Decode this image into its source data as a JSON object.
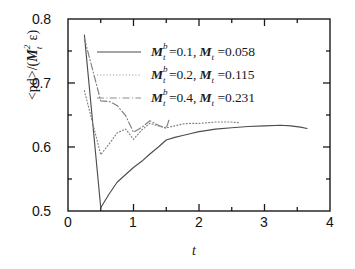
{
  "chart_data": {
    "type": "line",
    "title": "",
    "xlabel": "t",
    "ylabel": "<pd>/(M_t^2 ε)",
    "xlim": [
      0,
      4
    ],
    "ylim": [
      0.5,
      0.8
    ],
    "xticks": [
      0,
      1,
      2,
      3,
      4
    ],
    "xtick_labels": [
      "0",
      "1",
      "2",
      "3",
      "4"
    ],
    "xminor_ticks": [
      0.5,
      1.5,
      2.5,
      3.5
    ],
    "yticks": [
      0.5,
      0.6,
      0.7,
      0.8
    ],
    "ytick_labels": [
      "0.5",
      "0.6",
      "0.7",
      "0.8"
    ],
    "yminor_ticks": [
      0.55,
      0.65,
      0.75
    ],
    "grid": false,
    "legend_position": "upper-center",
    "series": [
      {
        "name": "Mtb=0.1, Mt=0.058",
        "style": "solid",
        "color": "#4d4d4d",
        "points": [
          [
            0.25,
            0.775
          ],
          [
            0.5,
            0.505
          ],
          [
            0.63,
            0.527
          ],
          [
            0.75,
            0.545
          ],
          [
            0.88,
            0.557
          ],
          [
            1.0,
            0.568
          ],
          [
            1.13,
            0.578
          ],
          [
            1.25,
            0.589
          ],
          [
            1.38,
            0.6
          ],
          [
            1.5,
            0.611
          ],
          [
            1.63,
            0.615
          ],
          [
            1.75,
            0.618
          ],
          [
            1.88,
            0.621
          ],
          [
            2.0,
            0.624
          ],
          [
            2.13,
            0.626
          ],
          [
            2.25,
            0.628
          ],
          [
            2.5,
            0.63
          ],
          [
            2.75,
            0.632
          ],
          [
            3.0,
            0.633
          ],
          [
            3.25,
            0.634
          ],
          [
            3.4,
            0.633
          ],
          [
            3.55,
            0.631
          ],
          [
            3.65,
            0.629
          ]
        ]
      },
      {
        "name": "Mtb=0.2, Mt=0.115",
        "style": "dotted",
        "color": "#808080",
        "points": [
          [
            0.25,
            0.688
          ],
          [
            0.5,
            0.588
          ],
          [
            0.63,
            0.605
          ],
          [
            0.75,
            0.622
          ],
          [
            0.88,
            0.628
          ],
          [
            1.0,
            0.612
          ],
          [
            1.13,
            0.627
          ],
          [
            1.25,
            0.637
          ],
          [
            1.38,
            0.633
          ],
          [
            1.5,
            0.63
          ],
          [
            1.63,
            0.633
          ],
          [
            1.75,
            0.636
          ],
          [
            1.88,
            0.637
          ],
          [
            2.0,
            0.637
          ],
          [
            2.13,
            0.638
          ],
          [
            2.25,
            0.639
          ],
          [
            2.38,
            0.639
          ],
          [
            2.5,
            0.639
          ],
          [
            2.6,
            0.638
          ]
        ]
      },
      {
        "name": "Mtb=0.4, Mt=0.231",
        "style": "dashdot",
        "color": "#808080",
        "points": [
          [
            0.25,
            0.77
          ],
          [
            0.5,
            0.672
          ],
          [
            0.63,
            0.671
          ],
          [
            0.75,
            0.665
          ],
          [
            0.88,
            0.649
          ],
          [
            1.0,
            0.623
          ],
          [
            1.13,
            0.631
          ],
          [
            1.25,
            0.641
          ],
          [
            1.38,
            0.634
          ],
          [
            1.5,
            0.629
          ],
          [
            1.55,
            0.645
          ]
        ]
      }
    ],
    "legend_entries": [
      {
        "style": "solid",
        "mb_symbol": "M",
        "mb_sub": "t",
        "mb_sup": "b",
        "mb_value": "=0.1,",
        "mt_symbol": "M",
        "mt_sub": "t",
        "mt_value": "=0.058"
      },
      {
        "style": "dotted",
        "mb_symbol": "M",
        "mb_sub": "t",
        "mb_sup": "b",
        "mb_value": "=0.2,",
        "mt_symbol": "M",
        "mt_sub": "t",
        "mt_value": "=0.115"
      },
      {
        "style": "dashdot",
        "mb_symbol": "M",
        "mb_sub": "t",
        "mb_sup": "b",
        "mb_value": "=0.4,",
        "mt_symbol": "M",
        "mt_sub": "t",
        "mt_value": "=0.231"
      }
    ]
  },
  "axes": {
    "y_label_parts": {
      "numerator": "<pd>",
      "slash": "/(",
      "m": "M",
      "m_sub": "t",
      "m_sup": "2",
      "eps": "ε",
      "close": ")"
    },
    "x_label": "t"
  }
}
